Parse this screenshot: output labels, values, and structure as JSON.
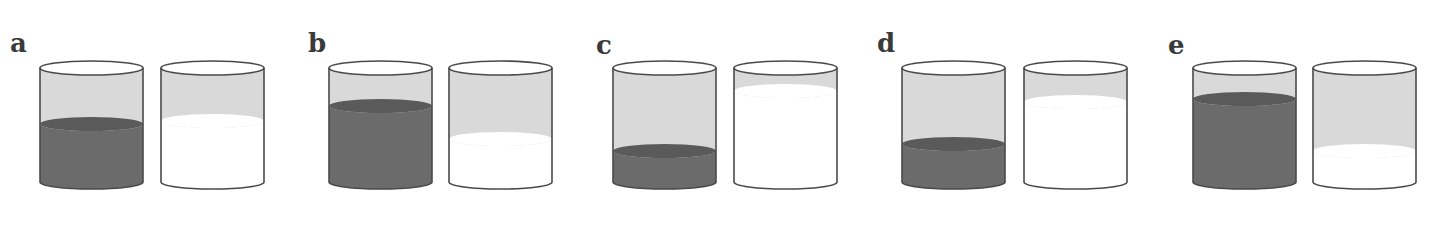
{
  "figure": {
    "colors": {
      "outline": "#4a4a4a",
      "light_fill": "#d9d9d9",
      "dark_fill": "#6b6b6b",
      "dark_top": "#5a5a5a",
      "white": "#ffffff"
    },
    "panels": [
      {
        "label": "a",
        "label_x": 10,
        "label_y": 30,
        "left_x": 40,
        "right_x": 161,
        "dark_level_y": 124,
        "white_level_y": 121
      },
      {
        "label": "b",
        "label_x": 308,
        "label_y": 30,
        "left_x": 329,
        "right_x": 449,
        "dark_level_y": 106,
        "white_level_y": 139
      },
      {
        "label": "c",
        "label_x": 596,
        "label_y": 32,
        "left_x": 613,
        "right_x": 734,
        "dark_level_y": 151,
        "white_level_y": 91
      },
      {
        "label": "d",
        "label_x": 877,
        "label_y": 30,
        "left_x": 902,
        "right_x": 1024,
        "dark_level_y": 144,
        "white_level_y": 102
      },
      {
        "label": "e",
        "label_x": 1168,
        "label_y": 32,
        "left_x": 1193,
        "right_x": 1313,
        "dark_level_y": 99,
        "white_level_y": 151
      }
    ],
    "cylinder": {
      "width": 103,
      "top_y": 68,
      "bottom_y": 182,
      "rx": 51.5,
      "ry": 7
    }
  }
}
